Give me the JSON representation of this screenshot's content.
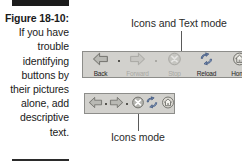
{
  "figure": {
    "label": "Figure 18-10:",
    "caption": "If you have trouble identifying buttons by their pictures alone, add descriptive text."
  },
  "annotations": {
    "top": "Icons and Text mode",
    "bottom": "Icons mode"
  },
  "colors": {
    "toolbar_face": "#d2d1cd",
    "toolbar_border": "#8d8d8a",
    "rule": "#1c1c1c",
    "text": "#1a1a1a",
    "disabled_text": "#a9a8a4",
    "arrow_fill": "#9a9a95",
    "accent_blue": "#4a6fa5"
  },
  "toolbars": [
    {
      "mode": "icons-and-text",
      "buttons": [
        {
          "label": "Back",
          "icon": "arrow-left-icon",
          "enabled": true,
          "has_dropdown": true
        },
        {
          "label": "Forward",
          "icon": "arrow-right-icon",
          "enabled": false,
          "has_dropdown": true
        },
        {
          "label": "Stop",
          "icon": "stop-icon",
          "enabled": false,
          "has_dropdown": false
        },
        {
          "label": "Reload",
          "icon": "reload-icon",
          "enabled": true,
          "has_dropdown": false
        },
        {
          "label": "Home",
          "icon": "home-icon",
          "enabled": true,
          "has_dropdown": false
        }
      ]
    },
    {
      "mode": "icons-only",
      "buttons": [
        {
          "label": "Back",
          "icon": "arrow-left-icon",
          "enabled": true,
          "has_dropdown": true
        },
        {
          "label": "Forward",
          "icon": "arrow-right-icon",
          "enabled": true,
          "has_dropdown": true
        },
        {
          "label": "Stop",
          "icon": "stop-icon",
          "enabled": true,
          "has_dropdown": false
        },
        {
          "label": "Reload",
          "icon": "reload-icon",
          "enabled": true,
          "has_dropdown": false
        },
        {
          "label": "Home",
          "icon": "home-icon",
          "enabled": true,
          "has_dropdown": false
        }
      ]
    }
  ]
}
